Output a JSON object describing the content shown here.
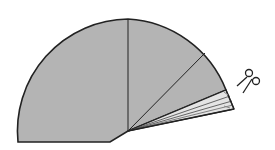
{
  "diagram": {
    "title": "",
    "colors": {
      "paper": "#b4b4b4",
      "paper_folded": "#dcdcdc",
      "paper_folded_light": "#ececec",
      "outline": "#222222",
      "background": "#ffffff"
    },
    "elements": [
      {
        "id": "paper-sector",
        "label": "unfolded paper"
      },
      {
        "id": "fold-line-vertical",
        "label": "fold line"
      },
      {
        "id": "fold-line-diagonal",
        "label": "fold line"
      },
      {
        "id": "folded-stack",
        "label": "folded layers"
      },
      {
        "id": "scissors",
        "label": "scissors icon"
      }
    ]
  }
}
